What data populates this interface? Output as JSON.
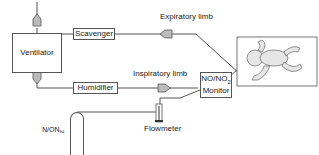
{
  "diagram": {
    "nodes": {
      "ventilator": "Ventilator",
      "scavenger": "Scavenger",
      "humidifier": "Humidifier",
      "monitor_line1": "NO/NO",
      "monitor_sub": "2",
      "monitor_line2": "Monitor",
      "flowmeter": "Flowmeter",
      "gas_source": "NO/N",
      "gas_source_sub": "2",
      "patient": "infant"
    },
    "labels": {
      "expiratory": "Expiratory limb",
      "inspiratory": "Inspiratory limb"
    },
    "colors": {
      "line": "#555555",
      "arrow_fill": "#bbbbbb",
      "infant_fill": "#e6e6e6"
    }
  }
}
